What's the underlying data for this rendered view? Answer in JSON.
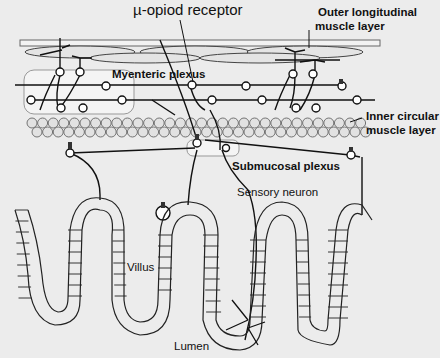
{
  "labels": {
    "mu_opioid_receptor": "µ-opiod receptor",
    "outer_longitudinal_1": "Outer longitudinal",
    "outer_longitudinal_2": "muscle layer",
    "myenteric_plexus": "Myenteric plexus",
    "inner_circular_1": "Inner circular",
    "inner_circular_2": "muscle layer",
    "submucosal_plexus": "Submucosal plexus",
    "sensory_neuron": "Sensory neuron",
    "villus": "Villus",
    "lumen": "Lumen"
  },
  "colors": {
    "background": "#ececec",
    "line": "#111111",
    "plexus_box": "#f4f4f4",
    "muscle_fill": "#e2e2e2"
  }
}
